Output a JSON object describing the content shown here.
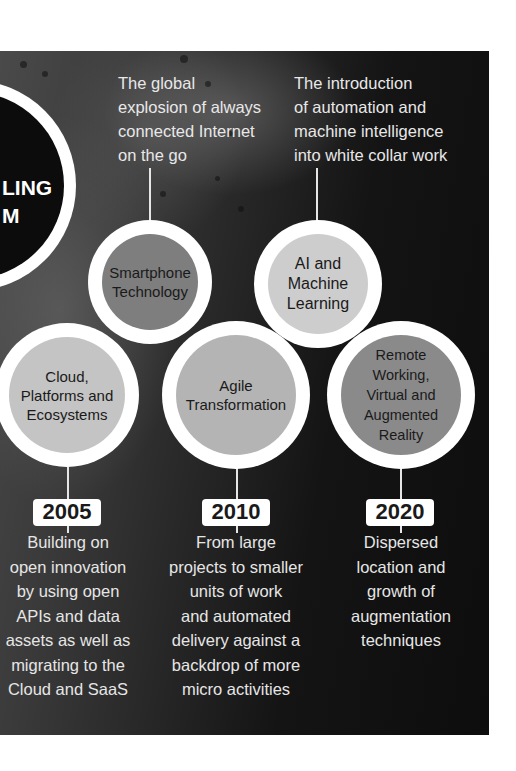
{
  "intro_circle": {
    "lines": [
      "LING",
      "M"
    ]
  },
  "top_captions": [
    {
      "id": "smartphone",
      "lines": [
        "The global",
        "explosion of always",
        "connected Internet",
        "on the go"
      ]
    },
    {
      "id": "ai",
      "lines": [
        "The introduction",
        "of automation and",
        "machine intelligence",
        "into white collar work"
      ]
    }
  ],
  "nodes": [
    {
      "id": "smartphone",
      "lines": [
        "Smartphone",
        "Technology"
      ],
      "fill": "#7e7e7e"
    },
    {
      "id": "ai",
      "lines": [
        "AI and",
        "Machine",
        "Learning"
      ],
      "fill": "#cdcdcd"
    },
    {
      "id": "cloud",
      "lines": [
        "Cloud,",
        "Platforms and",
        "Ecosystems"
      ],
      "fill": "#c4c4c4"
    },
    {
      "id": "agile",
      "lines": [
        "Agile",
        "Transformation"
      ],
      "fill": "#b4b4b4"
    },
    {
      "id": "remote",
      "lines": [
        "Remote",
        "Working,",
        "Virtual and",
        "Augmented",
        "Reality"
      ],
      "fill": "#8a8a8a"
    }
  ],
  "milestones": [
    {
      "year": "2005",
      "lines": [
        "Building on",
        "open innovation",
        "by using open",
        "APIs and data",
        "assets as well as",
        "migrating to the",
        "Cloud and SaaS"
      ]
    },
    {
      "year": "2010",
      "lines": [
        "From large",
        "projects to smaller",
        "units of work",
        "and automated",
        "delivery against a",
        "backdrop of more",
        "micro activities"
      ]
    },
    {
      "year": "2020",
      "lines": [
        "Dispersed",
        "location and",
        "growth of",
        "augmentation",
        "techniques"
      ]
    }
  ],
  "colors": {
    "ring": "#ffffff",
    "panel_dark": "#0d0d0d",
    "panel_light": "#4a4a4a",
    "text_light": "#e8e8e8",
    "text_dark": "#1a1a1a"
  }
}
